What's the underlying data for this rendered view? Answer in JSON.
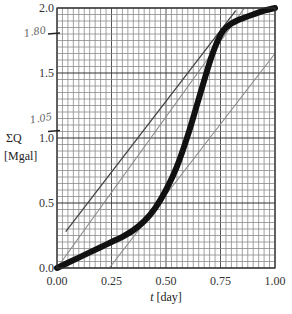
{
  "chart_data": {
    "type": "line",
    "title": "",
    "xlabel": "t [day]",
    "xlabel_var": "t",
    "xlabel_unit": "[day]",
    "ylabel": "ΣQ [Mgal]",
    "ylabel_var": "ΣQ",
    "ylabel_unit": "[Mgal]",
    "xlim": [
      0,
      1.0
    ],
    "ylim": [
      0,
      2.0
    ],
    "x_ticks": [
      0.0,
      0.25,
      0.5,
      0.75,
      1.0
    ],
    "x_tick_labels": [
      "0.00",
      "0.25",
      "0.50",
      "0.75",
      "1.00"
    ],
    "y_ticks": [
      0.0,
      0.5,
      1.0,
      1.5,
      2.0
    ],
    "y_tick_labels": [
      "0.0",
      "0.5",
      "1.0",
      "1.5",
      "2.0"
    ],
    "grid": true,
    "grid_minor_step_x": 0.025,
    "grid_minor_step_y": 0.05,
    "series": [
      {
        "name": "cumulative flow (mass curve)",
        "style": "thick-black",
        "color": "#111111",
        "x": [
          0.0,
          0.05,
          0.1,
          0.15,
          0.2,
          0.25,
          0.3,
          0.35,
          0.4,
          0.45,
          0.5,
          0.55,
          0.6,
          0.65,
          0.7,
          0.73,
          0.76,
          0.8,
          0.85,
          0.9,
          0.95,
          1.0
        ],
        "y": [
          0.0,
          0.04,
          0.08,
          0.12,
          0.16,
          0.2,
          0.24,
          0.29,
          0.36,
          0.46,
          0.6,
          0.78,
          1.02,
          1.3,
          1.58,
          1.72,
          1.82,
          1.88,
          1.92,
          1.95,
          1.98,
          2.0
        ]
      },
      {
        "name": "tangent line (upper)",
        "style": "thin-dark",
        "color": "#444444",
        "x": [
          0.04,
          0.82
        ],
        "y": [
          0.28,
          1.98
        ]
      },
      {
        "name": "supply line from origin",
        "style": "thin-gray",
        "color": "#888888",
        "x": [
          0.0,
          0.86
        ],
        "y": [
          0.0,
          2.0
        ]
      },
      {
        "name": "tangent line (lower)",
        "style": "thin-gray",
        "color": "#888888",
        "x": [
          0.24,
          1.0
        ],
        "y": [
          0.0,
          1.65
        ]
      }
    ],
    "annotations": [
      {
        "text": "1.80",
        "y": 1.8,
        "kind": "handwritten tick"
      },
      {
        "text": "1.05",
        "y": 1.05,
        "kind": "handwritten tick"
      }
    ]
  }
}
